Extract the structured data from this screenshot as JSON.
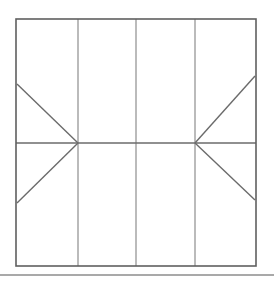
{
  "figure": {
    "canvas": {
      "width": 274,
      "height": 282,
      "background": "#ffffff"
    },
    "colors": {
      "outline": "#5f5f5f",
      "divider": "#8e8e8e",
      "diagonal": "#6b6b6b",
      "rule": "#8c8c8c"
    },
    "stroke_widths": {
      "outline": 1.6,
      "divider": 1.2,
      "diagonal": 1.4,
      "rule": 1.3
    },
    "outline": {
      "name": "outer-rectangle",
      "x": 16,
      "y": 19,
      "width": 240,
      "height": 247,
      "right": 256,
      "bottom": 266
    },
    "vertical_dividers": [
      {
        "name": "vertical-divider-1",
        "x": 78,
        "y1": 19,
        "y2": 266
      },
      {
        "name": "vertical-divider-2",
        "x": 136,
        "y1": 19,
        "y2": 266
      },
      {
        "name": "vertical-divider-3",
        "x": 195,
        "y1": 19,
        "y2": 266
      }
    ],
    "horizontal_dividers": [
      {
        "name": "horizontal-midline",
        "y": 143,
        "x1": 16,
        "x2": 256
      }
    ],
    "junctions": [
      {
        "name": "left-junction",
        "x": 78,
        "y": 143
      },
      {
        "name": "right-junction",
        "x": 195,
        "y": 143
      }
    ],
    "diagonals": [
      {
        "name": "diagonal-upper-left",
        "x1": 17,
        "y1": 84,
        "x2": 78,
        "y2": 143
      },
      {
        "name": "diagonal-lower-left",
        "x1": 17,
        "y1": 203,
        "x2": 78,
        "y2": 143
      },
      {
        "name": "diagonal-upper-right",
        "x1": 255,
        "y1": 76,
        "x2": 195,
        "y2": 143
      },
      {
        "name": "diagonal-lower-right",
        "x1": 255,
        "y1": 200,
        "x2": 195,
        "y2": 143
      }
    ],
    "baseline_rule": {
      "name": "baseline-rule",
      "y": 275,
      "x1": 0,
      "x2": 274
    },
    "labels": []
  }
}
